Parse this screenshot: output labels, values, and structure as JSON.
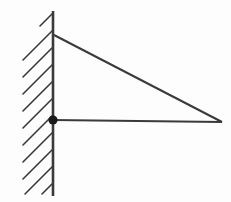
{
  "figure": {
    "canvas": {
      "width": 231,
      "height": 202,
      "background_color": "#fdfdfd"
    },
    "style": {
      "line_color": "#3a3a3a",
      "joint_color": "#1a1a1a",
      "member_stroke_width": 2,
      "wall_stroke_width": 2.6,
      "hatch_stroke_width": 1.6
    },
    "wall": {
      "name": "support wall",
      "orientation": "vertical",
      "x": 53,
      "y_top": 11,
      "y_bottom": 196,
      "hatch_side": "left",
      "hatch_angle_deg": 45,
      "hatch_count": 11,
      "hatch_spacing": 17,
      "hatch_length": 32
    },
    "joint": {
      "name": "pinned support",
      "label": "",
      "cx": 53,
      "cy": 120,
      "r": 4.6,
      "filled": true
    },
    "members": [
      {
        "name": "diagonal member",
        "type": "diagonal",
        "x1": 54,
        "y1": 35,
        "x2": 222,
        "y2": 122
      },
      {
        "name": "horizontal member",
        "type": "horizontal",
        "x1": 53,
        "y1": 120,
        "x2": 222,
        "y2": 122
      }
    ],
    "hatch_marks": [
      {
        "x1": 40,
        "y1": 26,
        "x2": 52,
        "y2": 14
      },
      {
        "x1": 23,
        "y1": 60,
        "x2": 52,
        "y2": 31
      },
      {
        "x1": 23,
        "y1": 77,
        "x2": 52,
        "y2": 48
      },
      {
        "x1": 23,
        "y1": 94,
        "x2": 52,
        "y2": 65
      },
      {
        "x1": 23,
        "y1": 111,
        "x2": 52,
        "y2": 82
      },
      {
        "x1": 23,
        "y1": 128,
        "x2": 52,
        "y2": 99
      },
      {
        "x1": 23,
        "y1": 145,
        "x2": 52,
        "y2": 116
      },
      {
        "x1": 23,
        "y1": 162,
        "x2": 52,
        "y2": 133
      },
      {
        "x1": 23,
        "y1": 179,
        "x2": 52,
        "y2": 150
      },
      {
        "x1": 25,
        "y1": 194,
        "x2": 52,
        "y2": 167
      },
      {
        "x1": 42,
        "y1": 194,
        "x2": 52,
        "y2": 184
      }
    ]
  }
}
